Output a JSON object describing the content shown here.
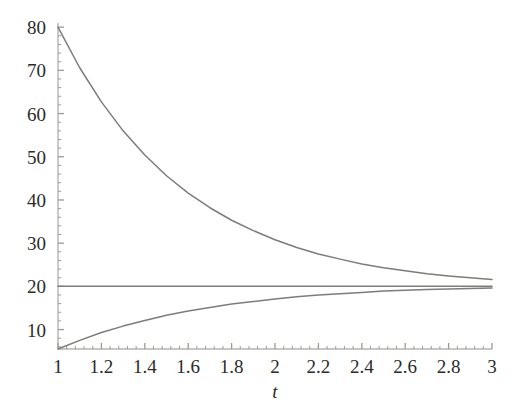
{
  "chart_data": {
    "type": "line",
    "title": "",
    "xlabel": "t",
    "ylabel": "",
    "xlim": [
      1,
      3
    ],
    "ylim": [
      5.5,
      80.5
    ],
    "grid": false,
    "legend": null,
    "xticks": [
      {
        "value": 1,
        "label": "1"
      },
      {
        "value": 1.2,
        "label": "1.2"
      },
      {
        "value": 1.4,
        "label": "1.4"
      },
      {
        "value": 1.6,
        "label": "1.6"
      },
      {
        "value": 1.8,
        "label": "1.8"
      },
      {
        "value": 2,
        "label": "2"
      },
      {
        "value": 2.2,
        "label": "2.2"
      },
      {
        "value": 2.4,
        "label": "2.4"
      },
      {
        "value": 2.6,
        "label": "2.6"
      },
      {
        "value": 2.8,
        "label": "2.8"
      },
      {
        "value": 3,
        "label": "3"
      }
    ],
    "yticks": [
      {
        "value": 10,
        "label": "10"
      },
      {
        "value": 20,
        "label": "20"
      },
      {
        "value": 30,
        "label": "30"
      },
      {
        "value": 40,
        "label": "40"
      },
      {
        "value": 50,
        "label": "50"
      },
      {
        "value": 60,
        "label": "60"
      },
      {
        "value": 70,
        "label": "70"
      },
      {
        "value": 80,
        "label": "80"
      }
    ],
    "x": [
      1,
      1.1,
      1.2,
      1.3,
      1.4,
      1.5,
      1.6,
      1.7,
      1.8,
      1.9,
      2,
      2.1,
      2.2,
      2.3,
      2.4,
      2.5,
      2.6,
      2.7,
      2.8,
      2.9,
      3
    ],
    "series": [
      {
        "name": "upper",
        "color": "#7c7c78",
        "values": [
          80.0,
          70.6,
          62.7,
          56.0,
          50.4,
          45.6,
          41.6,
          38.2,
          35.3,
          32.9,
          30.8,
          29.0,
          27.5,
          26.3,
          25.2,
          24.3,
          23.6,
          22.9,
          22.4,
          22.0,
          21.6
        ]
      },
      {
        "name": "equilibrium",
        "color": "#7c7c78",
        "values": [
          20,
          20,
          20,
          20,
          20,
          20,
          20,
          20,
          20,
          20,
          20,
          20,
          20,
          20,
          20,
          20,
          20,
          20,
          20,
          20,
          20
        ]
      },
      {
        "name": "lower",
        "color": "#7c7c78",
        "values": [
          5.5,
          7.5,
          9.3,
          10.8,
          12.1,
          13.3,
          14.3,
          15.1,
          15.9,
          16.5,
          17.1,
          17.6,
          18.0,
          18.3,
          18.6,
          18.9,
          19.1,
          19.3,
          19.4,
          19.5,
          19.6
        ]
      }
    ]
  },
  "axes": {
    "axis_color": "#b4b4b0",
    "tick_color": "#9a9a96",
    "text_color": "#2b2b2b"
  },
  "background": "#ffffff"
}
